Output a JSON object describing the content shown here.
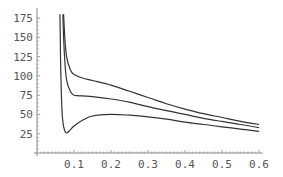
{
  "chart_data": {
    "type": "line",
    "title": "",
    "xlabel": "",
    "ylabel": "",
    "xlim": [
      0,
      0.6
    ],
    "ylim": [
      0,
      175
    ],
    "grid": false,
    "legend": null,
    "x_ticks": [
      "0.1",
      "0.2",
      "0.3",
      "0.4",
      "0.5",
      "0.6"
    ],
    "y_ticks": [
      "25",
      "50",
      "75",
      "100",
      "125",
      "150",
      "175"
    ],
    "series": [
      {
        "name": "upper",
        "points": [
          [
            0.072,
            180
          ],
          [
            0.075,
            150
          ],
          [
            0.08,
            125
          ],
          [
            0.09,
            108
          ],
          [
            0.1,
            102
          ],
          [
            0.125,
            97
          ],
          [
            0.15,
            94
          ],
          [
            0.2,
            88
          ],
          [
            0.25,
            80
          ],
          [
            0.3,
            72
          ],
          [
            0.35,
            64
          ],
          [
            0.4,
            57
          ],
          [
            0.45,
            51
          ],
          [
            0.5,
            46
          ],
          [
            0.55,
            41
          ],
          [
            0.6,
            37
          ]
        ]
      },
      {
        "name": "middle",
        "points": [
          [
            0.07,
            180
          ],
          [
            0.072,
            150
          ],
          [
            0.075,
            120
          ],
          [
            0.08,
            95
          ],
          [
            0.09,
            80
          ],
          [
            0.1,
            75
          ],
          [
            0.125,
            74
          ],
          [
            0.15,
            73
          ],
          [
            0.2,
            70
          ],
          [
            0.25,
            66
          ],
          [
            0.3,
            60
          ],
          [
            0.35,
            55
          ],
          [
            0.4,
            50
          ],
          [
            0.45,
            45
          ],
          [
            0.5,
            41
          ],
          [
            0.55,
            37
          ],
          [
            0.6,
            33
          ]
        ]
      },
      {
        "name": "lower",
        "points": [
          [
            0.062,
            180
          ],
          [
            0.063,
            150
          ],
          [
            0.064,
            110
          ],
          [
            0.066,
            75
          ],
          [
            0.069,
            45
          ],
          [
            0.074,
            30
          ],
          [
            0.08,
            26
          ],
          [
            0.09,
            30
          ],
          [
            0.1,
            35
          ],
          [
            0.125,
            43
          ],
          [
            0.15,
            48
          ],
          [
            0.2,
            50
          ],
          [
            0.25,
            49
          ],
          [
            0.3,
            47
          ],
          [
            0.35,
            44
          ],
          [
            0.4,
            40
          ],
          [
            0.45,
            37
          ],
          [
            0.5,
            34
          ],
          [
            0.55,
            31
          ],
          [
            0.6,
            28
          ]
        ]
      }
    ]
  },
  "axes": {
    "x_origin_px": 37,
    "y_origin_px": 153,
    "px_per_x": 370,
    "px_per_y": 0.771
  }
}
